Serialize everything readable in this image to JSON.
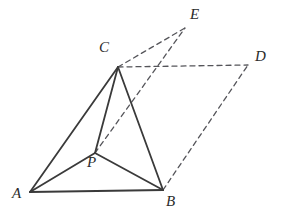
{
  "figure": {
    "kind": "solid-geometry-diagram",
    "canvas": {
      "width": 286,
      "height": 216
    },
    "background_color": "#ffffff",
    "stroke_color": "#3a3a3a",
    "dashed_stroke_color": "#55555a",
    "label_color": "#2b2b2b",
    "solid_stroke_width": 1.8,
    "dashed_stroke_width": 1.3,
    "dash_pattern": "5 4"
  },
  "points": [
    {
      "id": "A",
      "label": "A",
      "x": 30,
      "y": 192,
      "label_x": 12,
      "label_y": 186
    },
    {
      "id": "B",
      "label": "B",
      "x": 163,
      "y": 190,
      "label_x": 166,
      "label_y": 194
    },
    {
      "id": "C",
      "label": "C",
      "x": 118,
      "y": 67,
      "label_x": 99,
      "label_y": 40
    },
    {
      "id": "P",
      "label": "P",
      "x": 95,
      "y": 153,
      "label_x": 87,
      "label_y": 155
    },
    {
      "id": "D",
      "label": "D",
      "x": 248,
      "y": 65,
      "label_x": 255,
      "label_y": 49
    },
    {
      "id": "E",
      "label": "E",
      "x": 185,
      "y": 28,
      "label_x": 190,
      "label_y": 7
    }
  ],
  "edges": {
    "solid": [
      {
        "name": "edge-A-B",
        "from": "A",
        "to": "B"
      },
      {
        "name": "edge-A-C",
        "from": "A",
        "to": "C"
      },
      {
        "name": "edge-A-P",
        "from": "A",
        "to": "P"
      },
      {
        "name": "edge-P-B",
        "from": "P",
        "to": "B"
      },
      {
        "name": "edge-P-C",
        "from": "P",
        "to": "C"
      },
      {
        "name": "edge-C-B",
        "from": "C",
        "to": "B"
      }
    ],
    "dashed": [
      {
        "name": "edge-C-D",
        "from": "C",
        "to": "D"
      },
      {
        "name": "edge-C-E",
        "from": "C",
        "to": "E"
      },
      {
        "name": "edge-P-E",
        "from": "P",
        "to": "E"
      },
      {
        "name": "edge-B-D",
        "from": "B",
        "to": "D"
      }
    ]
  }
}
